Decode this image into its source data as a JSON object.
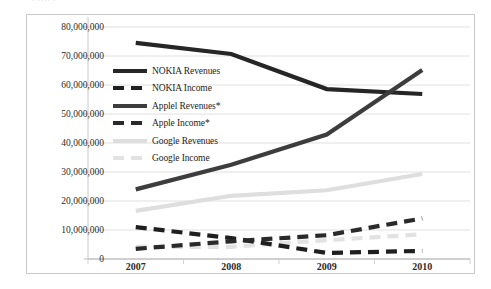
{
  "top_clipped_text": "· ···· ·",
  "chart_data": {
    "type": "line",
    "title": "",
    "subtitle": "",
    "xlabel": "",
    "ylabel": "",
    "x": [
      "2007",
      "2008",
      "2009",
      "2010"
    ],
    "categories": [
      "2007",
      "2008",
      "2009",
      "2010"
    ],
    "xlim": [
      "2007",
      "2010"
    ],
    "ylim": [
      0,
      80000000
    ],
    "y_ticks": [
      0,
      10000000,
      20000000,
      30000000,
      40000000,
      50000000,
      60000000,
      70000000,
      80000000
    ],
    "y_tick_labels": [
      "0",
      "10,000,000",
      "20,000,000",
      "30,000,000",
      "40,000,000",
      "50,000,000",
      "60,000,000",
      "70,000,000",
      "80,000,000"
    ],
    "grid": true,
    "grid_axis": "y",
    "legend_position": "inside-upper-left",
    "series": [
      {
        "name": "NOKIA Revenues",
        "values": [
          74500000,
          70700000,
          58600000,
          56900000
        ],
        "color": "#262626",
        "style": "solid",
        "width": 4.2
      },
      {
        "name": "NOKIA Income",
        "values": [
          11000000,
          7200000,
          2100000,
          2800000
        ],
        "color": "#1f1f1f",
        "style": "dashed",
        "width": 4.2
      },
      {
        "name": "Applel Revenues*",
        "values": [
          24000000,
          32500000,
          42900000,
          65200000
        ],
        "color": "#3d3d3d",
        "style": "solid",
        "width": 4.2
      },
      {
        "name": "Apple Income*",
        "values": [
          3500000,
          6100000,
          8200000,
          14000000
        ],
        "color": "#2a2a2a",
        "style": "dashed",
        "width": 4.2
      },
      {
        "name": "Google Revenues",
        "values": [
          16600000,
          21800000,
          23700000,
          29300000
        ],
        "color": "#dedede",
        "style": "solid",
        "width": 4.2
      },
      {
        "name": "Google Income",
        "values": [
          4200000,
          4200000,
          6500000,
          8500000
        ],
        "color": "#e2e2e2",
        "style": "dashed",
        "width": 4.2
      }
    ],
    "annotations": [
      "* Apple series marked with an asterisk"
    ]
  },
  "legend": {
    "items": [
      {
        "label": "NOKIA Revenues",
        "color": "#262626",
        "style": "solid"
      },
      {
        "label": "NOKIA Income",
        "color": "#1f1f1f",
        "style": "dashed"
      },
      {
        "label": "Applel Revenues*",
        "color": "#3d3d3d",
        "style": "solid"
      },
      {
        "label": "Apple Income*",
        "color": "#2a2a2a",
        "style": "dashed"
      },
      {
        "label": "Google Revenues",
        "color": "#dedede",
        "style": "solid"
      },
      {
        "label": "Google Income",
        "color": "#e2e2e2",
        "style": "dashed"
      }
    ]
  },
  "colors": {
    "plot_background": "#ffffff",
    "frame_border": "#c9c9c9",
    "gridline": "#dcdcdc",
    "axis_text": "#2b2b2b"
  }
}
